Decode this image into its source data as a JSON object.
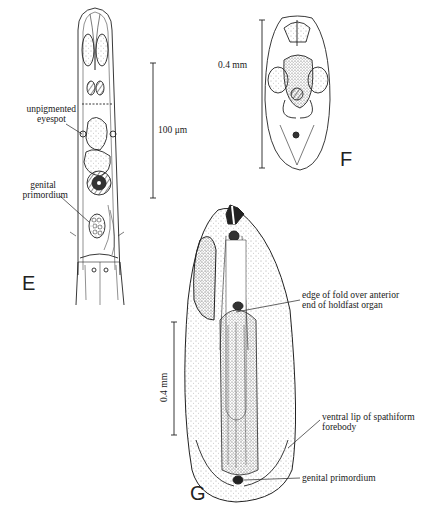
{
  "figure": {
    "panels": {
      "E": {
        "letter": "E",
        "labels": {
          "eyespot_1": "unpigmented",
          "eyespot_2": "eyespot",
          "genital_1": "genital",
          "genital_2": "primordium"
        },
        "scale_bar": "100 μm"
      },
      "F": {
        "letter": "F",
        "scale_bar": "0.4 mm"
      },
      "G": {
        "letter": "G",
        "scale_bar": "0.4 mm",
        "labels": {
          "fold_1": "edge of fold over anterior",
          "fold_2": "end of holdfast organ",
          "lip_1": "ventral lip of spathiform",
          "lip_2": "forebody",
          "genital": "genital primordium"
        }
      }
    }
  }
}
